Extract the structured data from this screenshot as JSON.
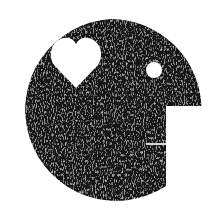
{
  "logo": {
    "name": "face-profile-logo",
    "shape": "circle-face",
    "colors": {
      "face": "#1a1a1a",
      "face_texture_light": "#6a6a6a",
      "background": "#ffffff",
      "cutouts": "#ffffff"
    },
    "features": {
      "left_eye": "heart-icon",
      "right_eye": "circle-dot-icon",
      "mouth": "horizontal-line"
    }
  }
}
